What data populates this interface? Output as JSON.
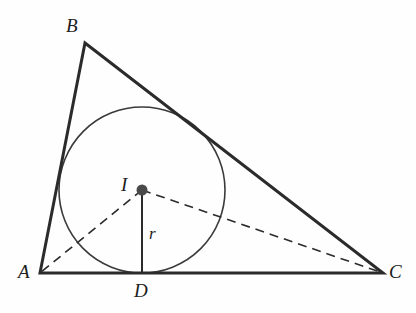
{
  "figure": {
    "kind": "geometry-diagram",
    "canvas": {
      "width": 416,
      "height": 313
    },
    "background_color": "#fefefe",
    "stroke_color": "#2b2b2b",
    "circle_color": "#3a3a3a",
    "dash_color": "#2b2b2b",
    "point_fill_color": "#4a4a4a",
    "triangle": {
      "stroke_width": 3,
      "vertices": [
        {
          "name": "A",
          "x": 40,
          "y": 273
        },
        {
          "name": "B",
          "x": 85,
          "y": 43
        },
        {
          "name": "C",
          "x": 383,
          "y": 273
        }
      ]
    },
    "incircle": {
      "center_x": 142,
      "center_y": 190,
      "radius": 83,
      "stroke_width": 1.6
    },
    "incenter_point": {
      "x": 142,
      "y": 190,
      "dot_radius": 5.5
    },
    "radius_segment": {
      "from_x": 142,
      "from_y": 190,
      "to_x": 142,
      "to_y": 273,
      "stroke_width": 2
    },
    "dashed_segments": [
      {
        "id": "I-to-A",
        "from_x": 142,
        "from_y": 190,
        "to_x": 40,
        "to_y": 273
      },
      {
        "id": "I-to-C",
        "from_x": 142,
        "from_y": 190,
        "to_x": 383,
        "to_y": 273
      }
    ],
    "dash_pattern": "9 6",
    "dash_width": 1.6
  },
  "labels": {
    "vertex_a": {
      "text": "A",
      "x": 18,
      "y": 262
    },
    "vertex_b": {
      "text": "B",
      "x": 66,
      "y": 16
    },
    "vertex_c": {
      "text": "C",
      "x": 389,
      "y": 262
    },
    "point_d": {
      "text": "D",
      "x": 134,
      "y": 281
    },
    "incenter_i": {
      "text": "I",
      "x": 121,
      "y": 175
    },
    "radius_r": {
      "text": "r",
      "x": 149,
      "y": 225
    }
  }
}
